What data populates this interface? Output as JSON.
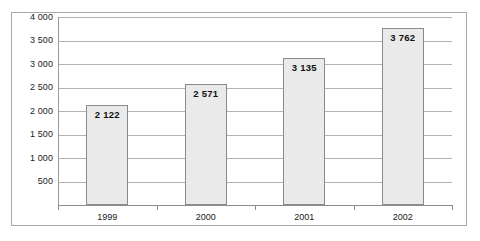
{
  "chart_data": {
    "type": "bar",
    "title": "",
    "xlabel": "",
    "ylabel": "",
    "categories": [
      "1999",
      "2000",
      "2001",
      "2002"
    ],
    "values": [
      2122,
      2571,
      3135,
      3762
    ],
    "value_labels": [
      "2 122",
      "2 571",
      "3 135",
      "3 762"
    ],
    "ylim": [
      0,
      4000
    ],
    "ytick_values": [
      500,
      1000,
      1500,
      2000,
      2500,
      3000,
      3500,
      4000
    ],
    "ytick_labels": [
      "500",
      "1 000",
      "1 500",
      "2 000",
      "2 500",
      "3 000",
      "3 500",
      "4 000"
    ],
    "grid": true,
    "legend": "none",
    "series": [
      {
        "name": "",
        "values": [
          2122,
          2571,
          3135,
          3762
        ]
      }
    ],
    "colors": {
      "bar_fill": "#eaeaea",
      "bar_border": "#8a8a8a",
      "gridline": "#b4b4b4",
      "axis": "#8d8d8d",
      "frame": "#a8a8a8",
      "text": "#1a1a1a",
      "background": "#ffffff"
    }
  }
}
